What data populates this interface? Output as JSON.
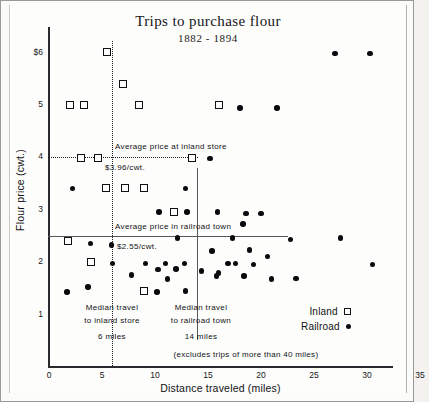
{
  "chart_data": {
    "type": "scatter",
    "title": "Trips to purchase flour",
    "subtitle": "1882 - 1894",
    "xlabel": "Distance traveled (miles)",
    "ylabel": "Flour price (cwt.)",
    "xlim": [
      0,
      35
    ],
    "ylim": [
      0,
      6.4
    ],
    "xticks": [
      "0",
      "5",
      "10",
      "15",
      "20",
      "25",
      "30",
      "35"
    ],
    "xtick_values": [
      0,
      5,
      10,
      15,
      20,
      25,
      30,
      35
    ],
    "yticks": [
      "$6",
      "5",
      "4",
      "3",
      "2",
      "1"
    ],
    "ytick_values": [
      6,
      5,
      4,
      3,
      2,
      1
    ],
    "grid": false,
    "legend_position": "bottom-right",
    "footnote": "(excludes trips of more than 40 miles)",
    "series": [
      {
        "name": "Inland",
        "marker": "open-square",
        "points": [
          [
            5.5,
            6.0
          ],
          [
            7.0,
            5.4
          ],
          [
            2.0,
            5.0
          ],
          [
            3.3,
            5.0
          ],
          [
            8.5,
            5.0
          ],
          [
            16.0,
            5.0
          ],
          [
            3.0,
            3.97
          ],
          [
            4.6,
            3.97
          ],
          [
            13.5,
            3.97
          ],
          [
            5.4,
            3.4
          ],
          [
            7.2,
            3.4
          ],
          [
            9.0,
            3.4
          ],
          [
            11.8,
            2.95
          ],
          [
            1.8,
            2.4
          ],
          [
            4.0,
            2.0
          ],
          [
            9.0,
            1.45
          ]
        ]
      },
      {
        "name": "Railroad",
        "marker": "filled-circle",
        "points": [
          [
            27.0,
            5.97
          ],
          [
            30.3,
            5.97
          ],
          [
            18.0,
            4.93
          ],
          [
            21.5,
            4.93
          ],
          [
            15.2,
            3.97
          ],
          [
            2.2,
            3.4
          ],
          [
            12.9,
            3.4
          ],
          [
            10.4,
            2.95
          ],
          [
            13.0,
            2.95
          ],
          [
            15.9,
            2.95
          ],
          [
            18.6,
            2.92
          ],
          [
            20.0,
            2.92
          ],
          [
            18.3,
            2.72
          ],
          [
            12.1,
            2.45
          ],
          [
            17.3,
            2.45
          ],
          [
            22.8,
            2.42
          ],
          [
            27.5,
            2.45
          ],
          [
            3.9,
            2.35
          ],
          [
            5.9,
            2.32
          ],
          [
            15.4,
            2.2
          ],
          [
            18.9,
            2.22
          ],
          [
            6.0,
            1.97
          ],
          [
            9.1,
            1.97
          ],
          [
            11.0,
            1.97
          ],
          [
            12.8,
            1.97
          ],
          [
            16.9,
            1.97
          ],
          [
            17.6,
            1.97
          ],
          [
            19.3,
            1.95
          ],
          [
            30.5,
            1.95
          ],
          [
            20.6,
            2.1
          ],
          [
            10.3,
            1.85
          ],
          [
            12.0,
            1.86
          ],
          [
            14.4,
            1.82
          ],
          [
            16.0,
            1.78
          ],
          [
            7.8,
            1.75
          ],
          [
            15.8,
            1.73
          ],
          [
            18.4,
            1.73
          ],
          [
            11.2,
            1.67
          ],
          [
            21.0,
            1.67
          ],
          [
            23.3,
            1.68
          ],
          [
            3.7,
            1.52
          ],
          [
            1.7,
            1.42
          ],
          [
            10.2,
            1.42
          ],
          [
            12.9,
            1.44
          ]
        ]
      }
    ],
    "reference_lines": [
      {
        "name": "average-price-inland-store",
        "orientation": "horizontal",
        "value": 3.96,
        "label": "Average price at inland store",
        "value_label": "$3.96/cwt.",
        "style": "dotted"
      },
      {
        "name": "average-price-railroad-town",
        "orientation": "horizontal",
        "value": 2.55,
        "label": "Average price in railroad town",
        "value_label": "$2.55/cwt.",
        "style": "solid"
      },
      {
        "name": "median-travel-inland-store",
        "orientation": "vertical",
        "value": 6,
        "label_line1": "Median travel",
        "label_line2": "to inland store",
        "value_label": "6 miles",
        "style": "dotted"
      },
      {
        "name": "median-travel-railroad-town",
        "orientation": "vertical",
        "value": 14,
        "label_line1": "Median travel",
        "label_line2": "to railroad town",
        "value_label": "14 miles",
        "style": "solid"
      }
    ]
  },
  "legend": {
    "inland_label": "Inland",
    "railroad_label": "Railroad"
  }
}
